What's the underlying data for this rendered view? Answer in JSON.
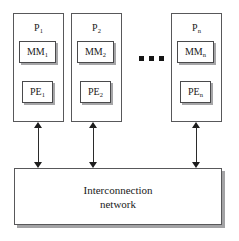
{
  "diagram": {
    "processors": [
      {
        "id": "p1",
        "label": "P",
        "subscript": "1",
        "memory": {
          "label": "MM",
          "subscript": "1"
        },
        "element": {
          "label": "PE",
          "subscript": "1"
        }
      },
      {
        "id": "p2",
        "label": "P",
        "subscript": "2",
        "memory": {
          "label": "MM",
          "subscript": "2"
        },
        "element": {
          "label": "PE",
          "subscript": "2"
        }
      },
      {
        "id": "pn",
        "label": "P",
        "subscript": "n",
        "memory": {
          "label": "MM",
          "subscript": "n"
        },
        "element": {
          "label": "PE",
          "subscript": "n"
        }
      }
    ],
    "ellipsis": {
      "dot_count": 3,
      "meaning": "more processors"
    },
    "network": {
      "line1": "Interconnection",
      "line2": "network"
    },
    "connections": {
      "count": 3,
      "style": "double-headed-vertical-arrow"
    },
    "colors": {
      "background": "#ffffff",
      "box_border": "#58585a",
      "inner_border": "#4a4a4c",
      "shadow": "#a6a6a8",
      "text": "#1a1a1a",
      "arrow": "#1d1d1d",
      "dot": "#151515"
    }
  }
}
